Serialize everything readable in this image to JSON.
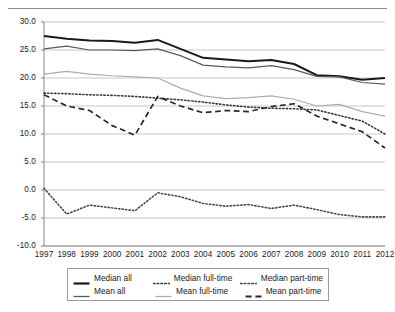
{
  "chart_data": {
    "type": "line",
    "title": "",
    "subtitle": "",
    "xlabel": "",
    "ylabel": "",
    "categories": [
      "1997",
      "1998",
      "1999",
      "2000",
      "2001",
      "2002",
      "2003",
      "2004",
      "2005",
      "2006",
      "2007",
      "2008",
      "2009",
      "2010",
      "2011",
      "2012"
    ],
    "xlim": [
      "1997",
      "2012"
    ],
    "ylim": [
      -10.0,
      30.0
    ],
    "yticks": [
      "30.0",
      "25.0",
      "20.0",
      "15.0",
      "10.0",
      "5.0",
      "0.0",
      "-5.0",
      "-10.0"
    ],
    "ytick_values": [
      30.0,
      25.0,
      20.0,
      15.0,
      10.0,
      5.0,
      0.0,
      -5.0,
      -10.0
    ],
    "grid": "horizontal",
    "legend_position": "bottom",
    "series": [
      {
        "name": "Median all",
        "style": "solid",
        "color": "#1a1a1a",
        "width": 2.0,
        "values": [
          27.5,
          27.0,
          26.7,
          26.6,
          26.3,
          26.8,
          25.2,
          23.6,
          23.3,
          23.0,
          23.2,
          22.5,
          20.5,
          20.3,
          19.7,
          20.0
        ]
      },
      {
        "name": "Mean all",
        "style": "solid",
        "color": "#5a5a5a",
        "width": 1.2,
        "values": [
          25.2,
          25.7,
          25.0,
          25.0,
          24.9,
          25.2,
          24.0,
          22.3,
          22.0,
          21.8,
          22.2,
          21.5,
          20.3,
          20.2,
          19.2,
          18.9
        ]
      },
      {
        "name": "Mean full-time",
        "style": "solid",
        "color": "#adadad",
        "width": 1.2,
        "values": [
          20.7,
          21.2,
          20.7,
          20.4,
          20.2,
          20.0,
          18.2,
          16.8,
          16.3,
          16.5,
          16.8,
          16.2,
          15.0,
          15.3,
          14.0,
          13.2
        ]
      },
      {
        "name": "Median full-time",
        "style": "dotted",
        "color": "#3c3c3c",
        "width": 1.6,
        "values": [
          17.3,
          17.2,
          17.0,
          16.9,
          16.7,
          16.4,
          16.1,
          15.7,
          15.2,
          14.8,
          14.6,
          14.5,
          14.3,
          13.3,
          12.3,
          10.0
        ]
      },
      {
        "name": "Mean part-time",
        "style": "dashed",
        "color": "#2a2a2a",
        "width": 1.7,
        "values": [
          17.0,
          15.0,
          14.2,
          11.5,
          9.8,
          16.7,
          15.0,
          13.8,
          14.2,
          14.0,
          14.9,
          15.4,
          13.2,
          11.8,
          10.4,
          7.5
        ]
      },
      {
        "name": "Median part-time",
        "style": "dotted",
        "color": "#4a4a4a",
        "width": 1.6,
        "values": [
          0.3,
          -4.3,
          -2.7,
          -3.2,
          -3.7,
          -0.5,
          -1.2,
          -2.4,
          -2.9,
          -2.6,
          -3.3,
          -2.7,
          -3.5,
          -4.4,
          -4.8,
          -4.8
        ]
      }
    ]
  },
  "axis": {
    "y_labels": [
      "30.0",
      "25.0",
      "20.0",
      "15.0",
      "10.0",
      "5.0",
      "0.0",
      "-5.0",
      "-10.0"
    ],
    "x_labels": [
      "1997",
      "1998",
      "1999",
      "2000",
      "2001",
      "2002",
      "2003",
      "2004",
      "2005",
      "2006",
      "2007",
      "2008",
      "2009",
      "2010",
      "2011",
      "2012"
    ]
  },
  "legend": {
    "items": [
      {
        "label": "Median all",
        "style": "solid-thick",
        "color": "#1a1a1a"
      },
      {
        "label": "Median full-time",
        "style": "dotted",
        "color": "#3c3c3c"
      },
      {
        "label": "Median part-time",
        "style": "dotted",
        "color": "#4a4a4a"
      },
      {
        "label": "Mean all",
        "style": "solid",
        "color": "#5a5a5a"
      },
      {
        "label": "Mean full-time",
        "style": "solid-light",
        "color": "#adadad"
      },
      {
        "label": "Mean part-time",
        "style": "dashed",
        "color": "#2a2a2a"
      }
    ]
  }
}
